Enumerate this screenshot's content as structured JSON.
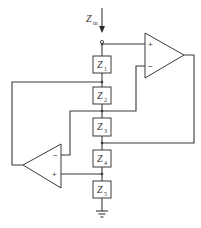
{
  "diagram": {
    "type": "circuit-schematic",
    "input": {
      "label": "Z",
      "subscript": "in"
    },
    "impedances": [
      {
        "label": "Z",
        "subscript": "1"
      },
      {
        "label": "Z",
        "subscript": "2"
      },
      {
        "label": "Z",
        "subscript": "3"
      },
      {
        "label": "Z",
        "subscript": "4"
      },
      {
        "label": "Z",
        "subscript": "5"
      }
    ],
    "opamps": [
      {
        "id": "opamp-1",
        "plus": "+",
        "minus": "−"
      },
      {
        "id": "opamp-2",
        "plus": "+",
        "minus": "−"
      }
    ],
    "ground": "ground-icon",
    "colors": {
      "line": "#3a3a3a",
      "background": "#ffffff"
    }
  }
}
